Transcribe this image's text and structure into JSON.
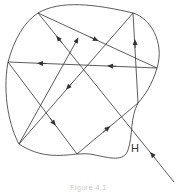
{
  "diagram": {
    "label_h": "H",
    "caption": "Figure 4.1",
    "stroke_color": "#333333",
    "vertices": {
      "A": [
        38,
        13
      ],
      "B": [
        133,
        13
      ],
      "C": [
        157,
        68
      ],
      "D": [
        8,
        62
      ],
      "E": [
        19,
        144
      ],
      "F": [
        77,
        154
      ],
      "G": [
        138,
        103
      ],
      "entry": [
        174,
        182
      ],
      "end": [
        77,
        40
      ]
    },
    "ray_path": [
      "entry",
      "A",
      "C",
      "D",
      "F",
      "G",
      "B",
      "E",
      "end"
    ]
  }
}
